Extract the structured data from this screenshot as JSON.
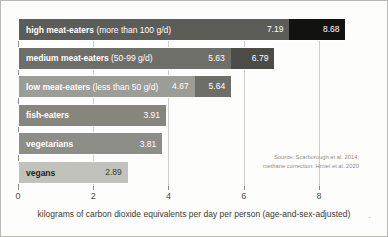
{
  "chart_data": {
    "type": "bar",
    "orientation": "horizontal",
    "title": "",
    "xlabel": "kilograms of carbon dioxide equivalents per day per person (age-and-sex-adjusted)",
    "ylabel": "",
    "xlim": [
      0,
      8.8
    ],
    "xticks": [
      0,
      2,
      4,
      6,
      8
    ],
    "xtick_labels": [
      "0",
      "2",
      "4",
      "6",
      "8"
    ],
    "grid": true,
    "legend": "none",
    "series": [
      {
        "name": "base estimate",
        "values": [
          7.19,
          5.63,
          4.67,
          3.91,
          3.81,
          2.89
        ]
      },
      {
        "name": "methane-corrected estimate",
        "values": [
          8.68,
          6.79,
          5.64,
          null,
          null,
          null
        ]
      }
    ],
    "categories": [
      "high meat-eaters (more than 100 g/d)",
      "medium meat-eaters (50-99 g/d)",
      "low meat-eaters (less than 50 g/d)",
      "fish-eaters",
      "vegetarians",
      "vegans"
    ],
    "bars": [
      {
        "label_strong": "high meat-eaters",
        "label_paren": "(more than 100 g/d)",
        "base_value": 7.19,
        "base_label": "7.19",
        "ext_value": 8.68,
        "ext_label": "8.68",
        "base_color": "#5c5c58",
        "ext_color": "#121210",
        "label_color": "#ffffff",
        "value_color": "#ffffff",
        "ext_value_color": "#ffffff"
      },
      {
        "label_strong": "medium meat-eaters",
        "label_paren": "(50-99 g/d)",
        "base_value": 5.63,
        "base_label": "5.63",
        "ext_value": 6.79,
        "ext_label": "6.79",
        "base_color": "#6f6f6a",
        "ext_color": "#4b4b47",
        "label_color": "#ffffff",
        "value_color": "#ffffff",
        "ext_value_color": "#ffffff"
      },
      {
        "label_strong": "low meat-eaters",
        "label_paren": "(less than 50 g/d)",
        "base_value": 4.67,
        "base_label": "4.67",
        "ext_value": 5.64,
        "ext_label": "5.64",
        "base_color": "#9d9d98",
        "ext_color": "#6e6e69",
        "label_color": "#ffffff",
        "value_color": "#ffffff",
        "ext_value_color": "#ffffff"
      },
      {
        "label_strong": "fish-eaters",
        "label_paren": "",
        "base_value": 3.91,
        "base_label": "3.91",
        "ext_value": null,
        "ext_label": "",
        "base_color": "#86867f",
        "ext_color": "",
        "label_color": "#ffffff",
        "value_color": "#ffffff",
        "ext_value_color": "#ffffff"
      },
      {
        "label_strong": "vegetarians",
        "label_paren": "",
        "base_value": 3.81,
        "base_label": "3.81",
        "ext_value": null,
        "ext_label": "",
        "base_color": "#8e8e88",
        "ext_color": "",
        "label_color": "#ffffff",
        "value_color": "#ffffff",
        "ext_value_color": "#ffffff"
      },
      {
        "label_strong": "vegans",
        "label_paren": "",
        "base_value": 2.89,
        "base_label": "2.89",
        "ext_value": null,
        "ext_label": "",
        "base_color": "#c2c2bd",
        "ext_color": "",
        "label_color": "#1e1e1c",
        "value_color": "#3a3a36",
        "ext_value_color": "#3a3a36"
      }
    ],
    "source_lines": [
      "Source: Scarborough et al. 2014;",
      "methane correction: Hmiel et al. 2020"
    ]
  }
}
